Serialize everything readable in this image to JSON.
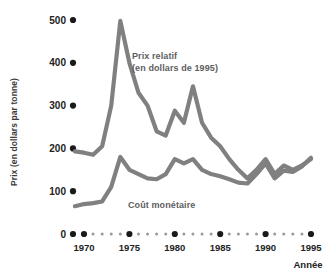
{
  "chart_data": {
    "type": "line",
    "title": "",
    "xlabel": "Année",
    "ylabel": "Prix (en dollars par tonne)",
    "xlim": [
      1969,
      1995
    ],
    "ylim": [
      0,
      500
    ],
    "grid": false,
    "legend_position": "inline-annotation",
    "x": [
      1969,
      1970,
      1971,
      1972,
      1973,
      1974,
      1975,
      1976,
      1977,
      1978,
      1979,
      1980,
      1981,
      1982,
      1983,
      1984,
      1985,
      1986,
      1987,
      1988,
      1989,
      1990,
      1991,
      1992,
      1993,
      1994,
      1995
    ],
    "xticks": [
      1970,
      1975,
      1980,
      1985,
      1990,
      1995
    ],
    "xtick_labels": [
      "1970",
      "1975",
      "1980",
      "1985",
      "1990",
      "1995"
    ],
    "yticks": [
      0,
      100,
      200,
      300,
      400,
      500
    ],
    "ytick_labels": [
      "0",
      "100",
      "200",
      "300",
      "400",
      "500"
    ],
    "series": [
      {
        "name": "Prix relatif (en dollars de 1995)",
        "label_line1": "Prix relatif",
        "label_line2": "(en dollars de 1995)",
        "color": "#808080",
        "values": [
          193,
          190,
          185,
          205,
          300,
          498,
          400,
          330,
          300,
          240,
          230,
          288,
          260,
          345,
          260,
          225,
          205,
          175,
          150,
          130,
          150,
          175,
          140,
          160,
          150,
          160,
          175
        ]
      },
      {
        "name": "Coût monétaire",
        "label_line1": "Coût monétaire",
        "color": "#808080",
        "values": [
          65,
          70,
          72,
          76,
          110,
          180,
          150,
          140,
          130,
          128,
          140,
          175,
          165,
          175,
          150,
          140,
          135,
          128,
          120,
          118,
          140,
          165,
          130,
          148,
          145,
          158,
          178
        ]
      }
    ]
  },
  "annotations": {
    "series_one_line1": "Prix relatif",
    "series_one_line2": "(en dollars de 1995)",
    "series_two_line1": "Coût monétaire"
  },
  "axes": {
    "y_title": "Prix (en dollars par tonne)",
    "x_title": "Année"
  },
  "colors": {
    "line": "#808080",
    "background": "#ffffff",
    "text": "#232323",
    "annotation_text": "#5e5e5e",
    "tick_dot": "#1a1a1a",
    "tick_dot_minor": "#9a9a9a"
  }
}
